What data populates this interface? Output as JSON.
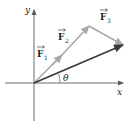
{
  "diagram": {
    "axes": {
      "x_label": "x",
      "y_label": "y"
    },
    "vectors": [
      {
        "id": "F1",
        "symbol": "F",
        "subscript": "1",
        "role": "component",
        "color": "#a7a9ac"
      },
      {
        "id": "F2",
        "symbol": "F",
        "subscript": "2",
        "role": "component",
        "color": "#a7a9ac"
      },
      {
        "id": "F3",
        "symbol": "F",
        "subscript": "3",
        "role": "component",
        "color": "#a7a9ac"
      },
      {
        "id": "R",
        "symbol": "",
        "subscript": "",
        "role": "resultant",
        "color": "#3a3a3c"
      }
    ],
    "angle": {
      "label": "θ",
      "between": [
        "x-axis",
        "resultant"
      ]
    },
    "colors": {
      "axis": "#58595b",
      "text": "#231f20",
      "component": "#a7a9ac",
      "resultant": "#3a3a3c"
    }
  }
}
